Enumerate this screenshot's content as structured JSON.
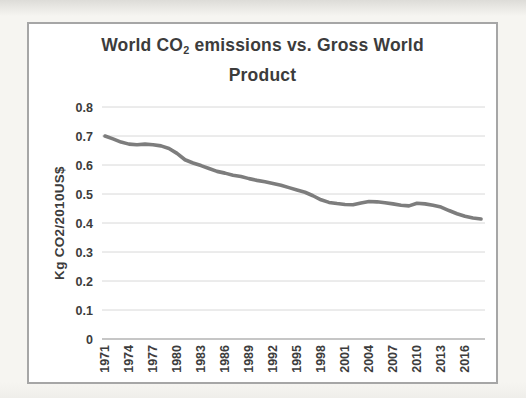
{
  "title": {
    "prefix": "World CO",
    "subscript": "2",
    "suffix": " emissions vs. Gross World Product"
  },
  "y_axis": {
    "label": "Kg CO2/2010US$"
  },
  "chart_data": {
    "type": "line",
    "title": "World CO2 emissions vs. Gross World Product",
    "xlabel": "",
    "ylabel": "Kg CO2/2010US$",
    "ylim": [
      0,
      0.8
    ],
    "y_ticks": [
      "0",
      "0.1",
      "0.2",
      "0.3",
      "0.4",
      "0.5",
      "0.6",
      "0.7",
      "0.8"
    ],
    "x_tick_labels": [
      "1971",
      "1974",
      "1977",
      "1980",
      "1983",
      "1986",
      "1989",
      "1992",
      "1995",
      "1998",
      "2001",
      "2004",
      "2007",
      "2010",
      "2013",
      "2016"
    ],
    "grid": "horizontal",
    "legend": "none",
    "line_color": "#7d7d7d",
    "gridline_color": "#d8d8d8",
    "axis_line_color": "#b3b3b3",
    "x": [
      1971,
      1972,
      1973,
      1974,
      1975,
      1976,
      1977,
      1978,
      1979,
      1980,
      1981,
      1982,
      1983,
      1984,
      1985,
      1986,
      1987,
      1988,
      1989,
      1990,
      1991,
      1992,
      1993,
      1994,
      1995,
      1996,
      1997,
      1998,
      1999,
      2000,
      2001,
      2002,
      2003,
      2004,
      2005,
      2006,
      2007,
      2008,
      2009,
      2010,
      2011,
      2012,
      2013,
      2014,
      2015,
      2016,
      2017,
      2018
    ],
    "values": [
      0.7,
      0.69,
      0.679,
      0.672,
      0.67,
      0.672,
      0.67,
      0.666,
      0.657,
      0.64,
      0.618,
      0.607,
      0.598,
      0.588,
      0.578,
      0.572,
      0.565,
      0.56,
      0.553,
      0.547,
      0.542,
      0.536,
      0.53,
      0.522,
      0.514,
      0.506,
      0.494,
      0.48,
      0.471,
      0.467,
      0.464,
      0.463,
      0.469,
      0.474,
      0.473,
      0.47,
      0.466,
      0.461,
      0.459,
      0.468,
      0.466,
      0.461,
      0.455,
      0.443,
      0.432,
      0.423,
      0.417,
      0.414
    ]
  }
}
